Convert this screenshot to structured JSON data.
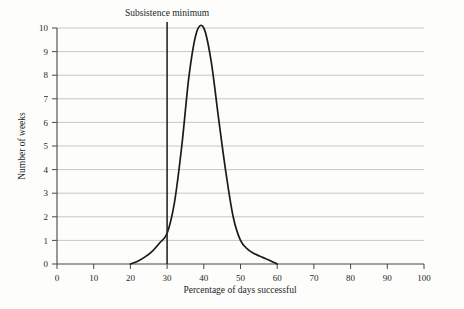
{
  "chart_data": {
    "type": "line",
    "title": "",
    "xlabel": "Percentage of days successful",
    "ylabel": "Number of weeks",
    "xlim": [
      0,
      100
    ],
    "ylim": [
      0,
      10
    ],
    "grid": true,
    "legend": null,
    "xticks": [
      0,
      10,
      20,
      30,
      40,
      50,
      60,
      70,
      80,
      90,
      100
    ],
    "yticks": [
      0,
      1,
      2,
      3,
      4,
      5,
      6,
      7,
      8,
      9,
      10
    ],
    "series": [
      {
        "name": "Distribution of weeks by percentage of successful days",
        "x": [
          20,
          22,
          24,
          26,
          28,
          30,
          32,
          34,
          36,
          38,
          40,
          42,
          44,
          46,
          48,
          50,
          52,
          54,
          56,
          58,
          60
        ],
        "values": [
          0.0,
          0.12,
          0.3,
          0.55,
          0.9,
          1.3,
          2.6,
          5.0,
          8.0,
          9.8,
          10.0,
          8.6,
          6.2,
          3.9,
          2.0,
          1.0,
          0.62,
          0.42,
          0.28,
          0.15,
          0.0
        ]
      }
    ],
    "annotations": [
      {
        "type": "vertical-line",
        "label": "Subsistence minimum",
        "x": 30
      }
    ]
  },
  "axis": {
    "x_label": "Percentage of days successful",
    "y_label": "Number of weeks",
    "x_tick_labels": [
      "0",
      "10",
      "20",
      "30",
      "40",
      "50",
      "60",
      "70",
      "80",
      "90",
      "100"
    ],
    "y_tick_labels": [
      "0",
      "1",
      "2",
      "3",
      "4",
      "5",
      "6",
      "7",
      "8",
      "9",
      "10"
    ]
  },
  "annotation": {
    "subsistence_label": "Subsistence minimum"
  },
  "colors": {
    "background": "#fdfdfb",
    "curve": "#1d1a1a",
    "gridline": "#b9b9b9",
    "axis": "#4a4746",
    "annotation_line": "#2a2727",
    "text": "#221f1f"
  }
}
